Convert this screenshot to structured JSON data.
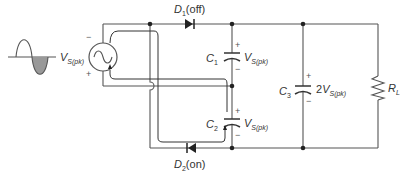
{
  "source": {
    "symbol": "V",
    "subscript": "S(pk)",
    "polarity_top": "−",
    "polarity_bottom": "+",
    "waveform": "sine, negative half-cycle shaded"
  },
  "diodes": {
    "d1": {
      "letter": "D",
      "index": "1",
      "state": "(off)"
    },
    "d2": {
      "letter": "D",
      "index": "2",
      "state": "(on)"
    }
  },
  "capacitors": {
    "c1": {
      "letter": "C",
      "index": "1",
      "voltage_prefix": "",
      "voltage_symbol": "V",
      "voltage_sub": "S(pk)",
      "plus": "+",
      "minus": "−"
    },
    "c2": {
      "letter": "C",
      "index": "2",
      "voltage_prefix": "",
      "voltage_symbol": "V",
      "voltage_sub": "S(pk)",
      "plus": "+",
      "minus": "−"
    },
    "c3": {
      "letter": "C",
      "index": "3",
      "voltage_prefix": "2",
      "voltage_symbol": "V",
      "voltage_sub": "S(pk)",
      "plus": "+",
      "minus": "−"
    }
  },
  "load": {
    "letter": "R",
    "index": "L"
  },
  "colors": {
    "wire": "#555555",
    "waveform_fill": "#999999"
  }
}
